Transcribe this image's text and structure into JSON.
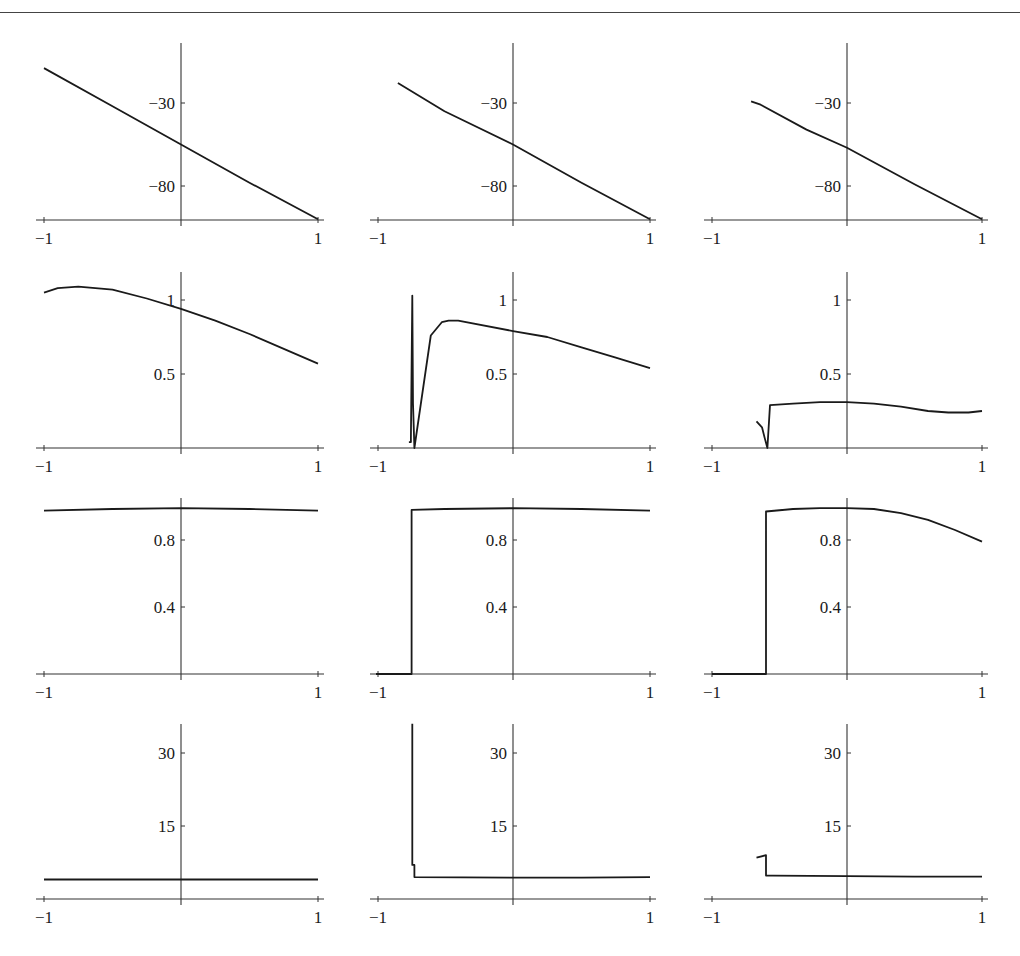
{
  "figure": {
    "layout": {
      "rows": 4,
      "cols": 3
    },
    "colors": {
      "line": "#1a1a1a",
      "axis": "#333333",
      "background": "#ffffff"
    }
  },
  "chart_data": [
    {
      "type": "line",
      "row": 1,
      "col": 1,
      "title": "",
      "xlabel": "",
      "ylabel": "",
      "xlim": [
        -1,
        1
      ],
      "ylim": [
        -100,
        -7
      ],
      "xticks": [
        "-1",
        "1"
      ],
      "yticks": [
        {
          "v": -30,
          "label": "-30"
        },
        {
          "v": -80,
          "label": "-80"
        }
      ],
      "x": [
        -1,
        -0.5,
        0,
        0.5,
        1
      ],
      "y": [
        -9,
        -32,
        -55,
        -78,
        -100
      ],
      "grid": false
    },
    {
      "type": "line",
      "row": 1,
      "col": 2,
      "title": "",
      "xlabel": "",
      "ylabel": "",
      "xlim": [
        -1,
        1
      ],
      "ylim": [
        -100,
        -7
      ],
      "xticks": [
        "-1",
        "1"
      ],
      "yticks": [
        {
          "v": -30,
          "label": "-30"
        },
        {
          "v": -80,
          "label": "-80"
        }
      ],
      "x": [
        -0.84,
        -0.5,
        0,
        0.5,
        1
      ],
      "y": [
        -18,
        -35,
        -55,
        -78,
        -100
      ],
      "grid": false
    },
    {
      "type": "line",
      "row": 1,
      "col": 3,
      "title": "",
      "xlabel": "",
      "ylabel": "",
      "xlim": [
        -1,
        1
      ],
      "ylim": [
        -100,
        -7
      ],
      "xticks": [
        "-1",
        "1"
      ],
      "yticks": [
        {
          "v": -30,
          "label": "-30"
        },
        {
          "v": -80,
          "label": "-80"
        }
      ],
      "x": [
        -0.71,
        -0.64,
        -0.3,
        0,
        0.5,
        1
      ],
      "y": [
        -29,
        -31,
        -46,
        -57,
        -79,
        -100
      ],
      "grid": false
    },
    {
      "type": "line",
      "row": 2,
      "col": 1,
      "title": "",
      "xlabel": "",
      "ylabel": "",
      "xlim": [
        -1,
        1
      ],
      "ylim": [
        0,
        1.2
      ],
      "xticks": [
        "-1",
        "1"
      ],
      "yticks": [
        {
          "v": 1,
          "label": "1"
        },
        {
          "v": 0.5,
          "label": "0.5"
        }
      ],
      "x": [
        -1,
        -0.9,
        -0.75,
        -0.5,
        -0.25,
        0,
        0.25,
        0.5,
        0.75,
        1
      ],
      "y": [
        1.05,
        1.08,
        1.09,
        1.07,
        1.01,
        0.94,
        0.86,
        0.77,
        0.67,
        0.57
      ],
      "grid": false
    },
    {
      "type": "line",
      "row": 2,
      "col": 2,
      "title": "",
      "xlabel": "",
      "ylabel": "",
      "xlim": [
        -1,
        1
      ],
      "ylim": [
        0,
        1.2
      ],
      "xticks": [
        "-1",
        "1"
      ],
      "yticks": [
        {
          "v": 1,
          "label": "1"
        },
        {
          "v": 0.5,
          "label": "0.5"
        }
      ],
      "x": [
        -0.76,
        -0.745,
        -0.745,
        -0.735,
        -0.73,
        -0.72,
        -0.6,
        -0.52,
        -0.47,
        -0.4,
        0,
        0.25,
        0.5,
        0.75,
        1
      ],
      "y": [
        0.04,
        0.04,
        0.06,
        1.03,
        0.3,
        0.0,
        0.76,
        0.85,
        0.86,
        0.86,
        0.79,
        0.75,
        0.68,
        0.61,
        0.54
      ],
      "grid": false
    },
    {
      "type": "line",
      "row": 2,
      "col": 3,
      "title": "",
      "xlabel": "",
      "ylabel": "",
      "xlim": [
        -1,
        1
      ],
      "ylim": [
        0,
        1.2
      ],
      "xticks": [
        "-1",
        "1"
      ],
      "yticks": [
        {
          "v": 1,
          "label": "1"
        },
        {
          "v": 0.5,
          "label": "0.5"
        }
      ],
      "x": [
        -0.67,
        -0.63,
        -0.61,
        -0.59,
        -0.57,
        -0.4,
        -0.2,
        0,
        0.2,
        0.4,
        0.6,
        0.75,
        0.9,
        1
      ],
      "y": [
        0.18,
        0.14,
        0.07,
        0.0,
        0.29,
        0.3,
        0.31,
        0.31,
        0.3,
        0.28,
        0.25,
        0.24,
        0.24,
        0.25
      ],
      "grid": false
    },
    {
      "type": "line",
      "row": 3,
      "col": 1,
      "title": "",
      "xlabel": "",
      "ylabel": "",
      "xlim": [
        -1,
        1
      ],
      "ylim": [
        0,
        1.05
      ],
      "xticks": [
        "-1",
        "1"
      ],
      "yticks": [
        {
          "v": 0.8,
          "label": "0.8"
        },
        {
          "v": 0.4,
          "label": "0.4"
        }
      ],
      "x": [
        -1,
        -0.5,
        0,
        0.5,
        1
      ],
      "y": [
        0.975,
        0.985,
        0.99,
        0.985,
        0.975
      ],
      "grid": false
    },
    {
      "type": "line",
      "row": 3,
      "col": 2,
      "title": "",
      "xlabel": "",
      "ylabel": "",
      "xlim": [
        -1,
        1
      ],
      "ylim": [
        0,
        1.05
      ],
      "xticks": [
        "-1",
        "1"
      ],
      "yticks": [
        {
          "v": 0.8,
          "label": "0.8"
        },
        {
          "v": 0.4,
          "label": "0.4"
        }
      ],
      "x": [
        -1,
        -0.74,
        -0.74,
        -0.5,
        0,
        0.5,
        1
      ],
      "y": [
        0,
        0,
        0.98,
        0.985,
        0.99,
        0.985,
        0.975
      ],
      "grid": false
    },
    {
      "type": "line",
      "row": 3,
      "col": 3,
      "title": "",
      "xlabel": "",
      "ylabel": "",
      "xlim": [
        -1,
        1
      ],
      "ylim": [
        0,
        1.05
      ],
      "xticks": [
        "-1",
        "1"
      ],
      "yticks": [
        {
          "v": 0.8,
          "label": "0.8"
        },
        {
          "v": 0.4,
          "label": "0.4"
        }
      ],
      "x": [
        -1,
        -0.6,
        -0.6,
        -0.4,
        -0.2,
        0,
        0.2,
        0.4,
        0.6,
        0.8,
        1
      ],
      "y": [
        0,
        0,
        0.97,
        0.985,
        0.99,
        0.99,
        0.985,
        0.96,
        0.92,
        0.86,
        0.79
      ],
      "grid": false
    },
    {
      "type": "line",
      "row": 4,
      "col": 1,
      "title": "",
      "xlabel": "",
      "ylabel": "",
      "xlim": [
        -1,
        1
      ],
      "ylim": [
        0,
        36
      ],
      "xticks": [
        "-1",
        "1"
      ],
      "yticks": [
        {
          "v": 30,
          "label": "30"
        },
        {
          "v": 15,
          "label": "15"
        }
      ],
      "x": [
        -1,
        -0.5,
        0,
        0.5,
        1
      ],
      "y": [
        4,
        4,
        4,
        4,
        4
      ],
      "grid": false
    },
    {
      "type": "line",
      "row": 4,
      "col": 2,
      "title": "",
      "xlabel": "",
      "ylabel": "",
      "xlim": [
        -1,
        1
      ],
      "ylim": [
        0,
        36
      ],
      "xticks": [
        "-1",
        "1"
      ],
      "yticks": [
        {
          "v": 30,
          "label": "30"
        },
        {
          "v": 15,
          "label": "15"
        }
      ],
      "x": [
        -0.735,
        -0.735,
        -0.72,
        -0.72,
        0,
        0.5,
        1
      ],
      "y": [
        36,
        7,
        7,
        4.5,
        4.4,
        4.4,
        4.5
      ],
      "grid": false
    },
    {
      "type": "line",
      "row": 4,
      "col": 3,
      "title": "",
      "xlabel": "",
      "ylabel": "",
      "xlim": [
        -1,
        1
      ],
      "ylim": [
        0,
        36
      ],
      "xticks": [
        "-1",
        "1"
      ],
      "yticks": [
        {
          "v": 30,
          "label": "30"
        },
        {
          "v": 15,
          "label": "15"
        }
      ],
      "x": [
        -0.67,
        -0.6,
        -0.6,
        -0.55,
        0,
        0.5,
        1
      ],
      "y": [
        8.5,
        9,
        4.8,
        4.8,
        4.7,
        4.6,
        4.6
      ],
      "grid": false
    }
  ]
}
